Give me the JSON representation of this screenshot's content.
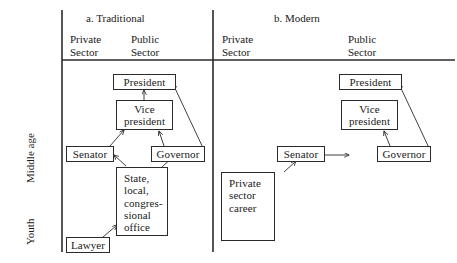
{
  "figure": {
    "panels": [
      {
        "id": "traditional",
        "title": "a. Traditional",
        "columns": [
          "Private\nSector",
          "Public\nSector"
        ],
        "nodes": [
          {
            "id": "president",
            "label": "President"
          },
          {
            "id": "vice-president",
            "label": "Vice\npresident"
          },
          {
            "id": "senator",
            "label": "Senator"
          },
          {
            "id": "governor",
            "label": "Governor"
          },
          {
            "id": "state-local-office",
            "label": "State,\nlocal,\ncongres-\nsional\noffice"
          },
          {
            "id": "lawyer",
            "label": "Lawyer"
          }
        ]
      },
      {
        "id": "modern",
        "title": "b. Modern",
        "columns": [
          "Private\nSector",
          "Public\nSector"
        ],
        "nodes": [
          {
            "id": "president",
            "label": "President"
          },
          {
            "id": "vice-president",
            "label": "Vice\npresident"
          },
          {
            "id": "senator",
            "label": "Senator"
          },
          {
            "id": "governor",
            "label": "Governor"
          },
          {
            "id": "private-sector-career",
            "label": "Private\nsector\ncareer"
          }
        ]
      }
    ],
    "vertical_axis": {
      "labels": [
        "Middle age",
        "Youth"
      ]
    },
    "colors": {
      "line": "#2b2b2b",
      "background": "#ffffff",
      "text": "#1a1a1a"
    }
  }
}
